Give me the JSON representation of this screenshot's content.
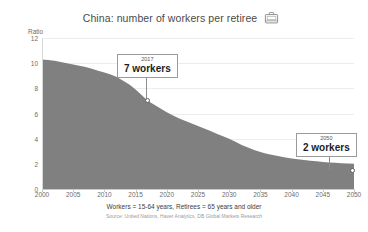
{
  "header": {
    "title": "China: number of workers per retiree",
    "icon": "briefcase-icon"
  },
  "footnotes": {
    "definition": "Workers = 15-64 years, Retirees = 65 years and older",
    "source": "Source: United Nations, Haver Analytics, DB Global Markets Research"
  },
  "callouts": [
    {
      "id": "2017",
      "year": "2017",
      "value": "7 workers"
    },
    {
      "id": "2050",
      "year": "2050",
      "value": "2 workers"
    }
  ],
  "colors": {
    "area_fill": "#808080",
    "gridline": "#ededed",
    "axis": "#c9c9c9",
    "text": "#4a4a4a"
  },
  "chart_data": {
    "type": "area",
    "title": "China: number of workers per retiree",
    "xlabel": "",
    "ylabel": "Ratio",
    "ylim": [
      0,
      12
    ],
    "xlim": [
      2000,
      2050
    ],
    "grid": true,
    "legend": false,
    "ytick_labels": [
      "0",
      "2",
      "4",
      "6",
      "8",
      "10",
      "12"
    ],
    "yticks": [
      0,
      2,
      4,
      6,
      8,
      10,
      12
    ],
    "xtick_labels": [
      "2000",
      "2005",
      "2010",
      "2015",
      "2020",
      "2025",
      "2030",
      "2035",
      "2040",
      "2045",
      "2050"
    ],
    "xticks": [
      2000,
      2005,
      2010,
      2015,
      2020,
      2025,
      2030,
      2035,
      2040,
      2045,
      2050
    ],
    "x": [
      2000,
      2001,
      2002,
      2003,
      2004,
      2005,
      2006,
      2007,
      2008,
      2009,
      2010,
      2011,
      2012,
      2013,
      2014,
      2015,
      2016,
      2017,
      2018,
      2019,
      2020,
      2021,
      2022,
      2023,
      2024,
      2025,
      2026,
      2027,
      2028,
      2029,
      2030,
      2031,
      2032,
      2033,
      2034,
      2035,
      2036,
      2037,
      2038,
      2039,
      2040,
      2041,
      2042,
      2043,
      2044,
      2045,
      2046,
      2047,
      2048,
      2049,
      2050
    ],
    "values": [
      10.3,
      10.25,
      10.2,
      10.1,
      10.0,
      9.9,
      9.8,
      9.7,
      9.55,
      9.4,
      9.25,
      9.1,
      8.9,
      8.6,
      8.3,
      7.9,
      7.45,
      7.0,
      6.7,
      6.4,
      6.1,
      5.85,
      5.6,
      5.4,
      5.2,
      5.0,
      4.8,
      4.6,
      4.4,
      4.2,
      4.0,
      3.75,
      3.5,
      3.3,
      3.1,
      2.95,
      2.8,
      2.7,
      2.6,
      2.5,
      2.42,
      2.36,
      2.3,
      2.25,
      2.2,
      2.15,
      2.11,
      2.08,
      2.05,
      2.02,
      2.0
    ],
    "annotations": [
      {
        "x": 2017,
        "y": 7,
        "label": "2017 — 7 workers"
      },
      {
        "x": 2050,
        "y": 2,
        "label": "2050 — 2 workers"
      }
    ],
    "series": [
      {
        "name": "Workers per retiree",
        "color": "#808080"
      }
    ]
  }
}
